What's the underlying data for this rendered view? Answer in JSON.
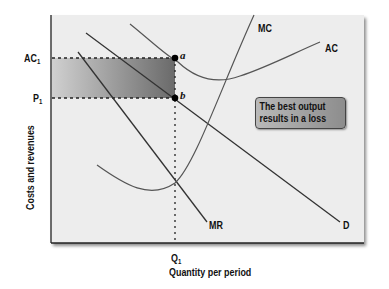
{
  "axes": {
    "y_label": "Costs and revenues",
    "x_label": "Quantity per period",
    "y_ticks": [
      {
        "label": "AC",
        "sub": "1"
      },
      {
        "label": "P",
        "sub": "1"
      }
    ],
    "x_ticks": [
      {
        "label": "Q",
        "sub": "1"
      }
    ]
  },
  "curves": {
    "mc": "MC",
    "ac": "AC",
    "mr": "MR",
    "d": "D"
  },
  "points": {
    "a": "a",
    "b": "b"
  },
  "callout": {
    "line1": "The best output",
    "line2": "results in a loss"
  },
  "colors": {
    "panel_bg": "#ededed",
    "curve": "#333333",
    "loss_area_dark": "#6e6e6e",
    "loss_area_light": "#d0d0d0",
    "callout_bg": "#9f9f9f"
  }
}
